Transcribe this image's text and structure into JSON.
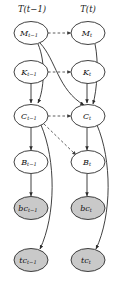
{
  "diagram": {
    "title_left": "T(t−1)",
    "title_right": "T(t)",
    "background_color": "#ffffff",
    "stroke_color": "#2b2b2b",
    "shaded_fill": "#c9c9c9",
    "plain_fill": "#ffffff"
  },
  "nodes": {
    "m_prev": {
      "base": "M",
      "sub": "t−1",
      "shaded": false
    },
    "k_prev": {
      "base": "K",
      "sub": "t−1",
      "shaded": false
    },
    "c_prev": {
      "base": "C",
      "sub": "t−1",
      "shaded": false
    },
    "b_prev": {
      "base": "B",
      "sub": "t−1",
      "shaded": false
    },
    "bc_prev": {
      "base": "bc",
      "sub": "t−1",
      "shaded": true
    },
    "tc_prev": {
      "base": "tc",
      "sub": "t−1",
      "shaded": true
    },
    "m_cur": {
      "base": "M",
      "sub": "t",
      "shaded": false
    },
    "k_cur": {
      "base": "K",
      "sub": "t",
      "shaded": false
    },
    "c_cur": {
      "base": "C",
      "sub": "t",
      "shaded": false
    },
    "b_cur": {
      "base": "B",
      "sub": "t",
      "shaded": false
    },
    "bc_cur": {
      "base": "bc",
      "sub": "t",
      "shaded": true
    },
    "tc_cur": {
      "base": "tc",
      "sub": "t",
      "shaded": true
    }
  },
  "edges": [
    {
      "from": "m_prev",
      "to": "m_cur",
      "style": "dashed"
    },
    {
      "from": "k_prev",
      "to": "k_cur",
      "style": "dashed"
    },
    {
      "from": "c_prev",
      "to": "c_cur",
      "style": "dashed"
    },
    {
      "from": "c_prev",
      "to": "b_cur",
      "style": "dashed"
    },
    {
      "from": "m_prev",
      "to": "c_prev",
      "style": "solid"
    },
    {
      "from": "k_prev",
      "to": "c_prev",
      "style": "solid"
    },
    {
      "from": "m_prev",
      "to": "c_cur",
      "style": "solid"
    },
    {
      "from": "m_cur",
      "to": "c_cur",
      "style": "solid"
    },
    {
      "from": "k_cur",
      "to": "c_cur",
      "style": "solid"
    },
    {
      "from": "c_prev",
      "to": "b_prev",
      "style": "solid"
    },
    {
      "from": "b_prev",
      "to": "bc_prev",
      "style": "solid"
    },
    {
      "from": "c_prev",
      "to": "tc_prev",
      "style": "solid"
    },
    {
      "from": "c_cur",
      "to": "b_cur",
      "style": "solid"
    },
    {
      "from": "b_cur",
      "to": "bc_cur",
      "style": "solid"
    },
    {
      "from": "c_cur",
      "to": "tc_cur",
      "style": "solid"
    }
  ]
}
